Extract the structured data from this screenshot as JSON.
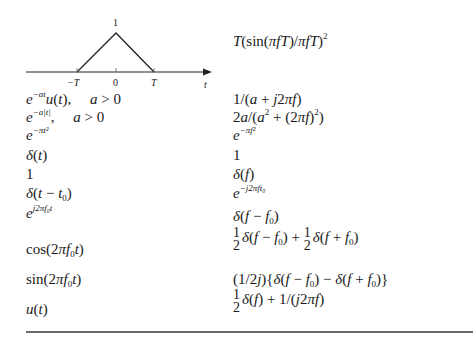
{
  "figure": {
    "type": "triangle-pulse-plot",
    "peak_label": "1",
    "tick_labels": [
      "-T",
      "0",
      "T"
    ],
    "axis_label": "t",
    "transform": "T(sin(πfT)/πfT)²"
  },
  "table": {
    "columns": [
      "Signal",
      "Fourier Transform"
    ],
    "rows": [
      {
        "signal": "e^{-at}u(t),   a > 0",
        "transform": "1/(a + j2πf)"
      },
      {
        "signal": "e^{-a|t|},   a > 0",
        "transform": "2a/(a² + (2πf)²)"
      },
      {
        "signal": "e^{-πt²}",
        "transform": "e^{-πf²}"
      },
      {
        "signal": "δ(t)",
        "transform": "1"
      },
      {
        "signal": "1",
        "transform": "δ(f)"
      },
      {
        "signal": "δ(t − t₀)",
        "transform": "e^{-j2πft₀}"
      },
      {
        "signal": "e^{j2πf₀t}",
        "transform": "δ(f − f₀)"
      },
      {
        "signal": "cos(2πf₀t)",
        "transform": "½δ(f − f₀) + ½δ(f + f₀)"
      },
      {
        "signal": "sin(2πf₀t)",
        "transform": "(1/2j){δ(f − f₀) − δ(f + f₀)}"
      },
      {
        "signal": "u(t)",
        "transform": "½δ(f) + 1/(j2πf)"
      }
    ]
  },
  "text": {
    "peak": "1",
    "tick_neg_T": "−T",
    "tick_zero": "0",
    "tick_T": "T",
    "axis_t": "t",
    "one": "1",
    "two": "2",
    "a_gt_0": "a > 0"
  }
}
